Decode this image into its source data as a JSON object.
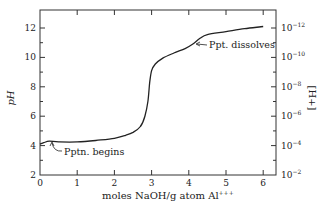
{
  "chart_data": {
    "type": "line",
    "title": "",
    "xlabel": "moles NaOH/g atom Al",
    "xlabel_superscript": "+++",
    "ylabel": "pH",
    "y2label": "[H+]",
    "xlim": [
      0,
      6.2
    ],
    "ylim": [
      2,
      13
    ],
    "grid": false,
    "x_ticks": [
      0,
      1,
      2,
      3,
      4,
      5,
      6
    ],
    "x_tick_labels": [
      "0",
      "1",
      "2",
      "3",
      "4",
      "5",
      "6"
    ],
    "y_ticks": [
      2,
      4,
      6,
      8,
      10,
      12
    ],
    "y_tick_labels": [
      "2",
      "4",
      "6",
      "8",
      "10",
      "12"
    ],
    "y_minor_ticks": [
      3,
      5,
      7,
      9,
      11
    ],
    "y2_ticks": [
      2,
      4,
      6,
      8,
      10,
      12
    ],
    "y2_tick_labels": [
      {
        "base": "10",
        "exp": "−2"
      },
      {
        "base": "10",
        "exp": "−4"
      },
      {
        "base": "10",
        "exp": "−6"
      },
      {
        "base": "10",
        "exp": "−8"
      },
      {
        "base": "10",
        "exp": "−10"
      },
      {
        "base": "10",
        "exp": "−12"
      }
    ],
    "series": [
      {
        "name": "titration curve",
        "x": [
          0.0,
          0.1,
          0.25,
          0.5,
          1.0,
          1.5,
          2.0,
          2.3,
          2.5,
          2.7,
          2.82,
          2.9,
          2.95,
          3.0,
          3.1,
          3.3,
          3.6,
          3.9,
          4.1,
          4.3,
          4.5,
          5.0,
          5.5,
          6.0
        ],
        "y": [
          4.1,
          4.2,
          4.3,
          4.25,
          4.25,
          4.35,
          4.5,
          4.7,
          4.9,
          5.3,
          6.0,
          7.0,
          8.3,
          9.1,
          9.55,
          9.95,
          10.3,
          10.6,
          10.9,
          11.3,
          11.55,
          11.75,
          11.95,
          12.1
        ]
      }
    ],
    "annotations": [
      {
        "text": "Pptn. begins",
        "x": 0.15,
        "y": 4.1
      },
      {
        "text": "Ppt. dissolves",
        "x": 4.2,
        "y": 11.0
      }
    ]
  }
}
